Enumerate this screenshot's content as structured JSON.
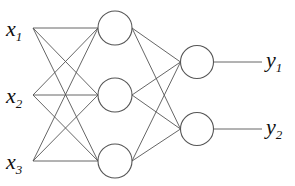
{
  "diagram": {
    "type": "neural-network",
    "colors": {
      "stroke": "#555555",
      "text": "#111111",
      "background": "#ffffff"
    },
    "inputs": [
      {
        "id": "x1",
        "base": "x",
        "sub": "1",
        "label": "x1",
        "x": 33,
        "y": 28
      },
      {
        "id": "x2",
        "base": "x",
        "sub": "2",
        "label": "x2",
        "x": 33,
        "y": 95
      },
      {
        "id": "x3",
        "base": "x",
        "sub": "3",
        "label": "x3",
        "x": 33,
        "y": 161
      }
    ],
    "hidden": [
      {
        "id": "h1",
        "cx": 115,
        "cy": 28,
        "r": 17
      },
      {
        "id": "h2",
        "cx": 115,
        "cy": 95,
        "r": 17
      },
      {
        "id": "h3",
        "cx": 115,
        "cy": 161,
        "r": 17
      }
    ],
    "outputs": [
      {
        "id": "o1",
        "cx": 197,
        "cy": 62,
        "r": 16.5,
        "line_end": 262,
        "base": "y",
        "sub": "1",
        "label": "y1"
      },
      {
        "id": "o2",
        "cx": 197,
        "cy": 129,
        "r": 16.5,
        "line_end": 262,
        "base": "y",
        "sub": "2",
        "label": "y2"
      }
    ]
  }
}
